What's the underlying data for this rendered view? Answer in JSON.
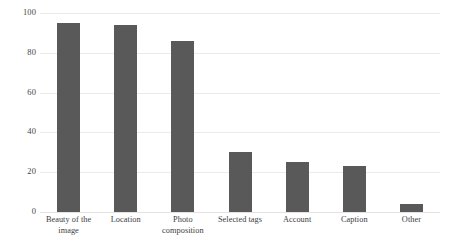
{
  "chart_data": {
    "type": "bar",
    "title": "",
    "subtitle": "",
    "xlabel": "",
    "ylabel": "",
    "ylim": [
      0,
      100
    ],
    "ytick_labels": [
      "100",
      "80",
      "60",
      "40",
      "20",
      "0"
    ],
    "ytick_values": [
      100,
      80,
      60,
      40,
      20,
      0
    ],
    "grid": true,
    "legend": false,
    "legend_position": "none",
    "bar_color": "#595959",
    "gridline_color": "#eceaea",
    "background_color": "#ffffff",
    "categories": [
      "Beauty of the image",
      "Location",
      "Photo composition",
      "Selected tags",
      "Account",
      "Caption",
      "Other"
    ],
    "category_lines": [
      [
        "Beauty of the",
        "image"
      ],
      [
        "Location"
      ],
      [
        "Photo",
        "composition"
      ],
      [
        "Selected tags"
      ],
      [
        "Account"
      ],
      [
        "Caption"
      ],
      [
        "Other"
      ]
    ],
    "values": [
      95,
      94,
      86,
      30,
      25,
      23,
      4
    ]
  }
}
